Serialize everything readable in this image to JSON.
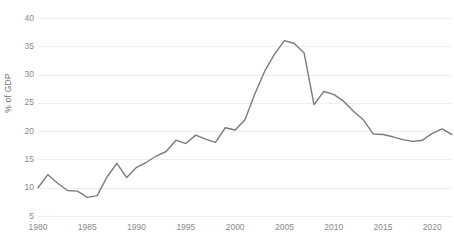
{
  "chart_data": {
    "type": "line",
    "title": "",
    "subtitle": "",
    "xlabel": "",
    "ylabel": "% of GDP",
    "xlim": [
      1980,
      2022
    ],
    "ylim": [
      5,
      40
    ],
    "grid": true,
    "legend": false,
    "legend_position": "none",
    "line_color": "#7b7b7b",
    "grid_color": "#eeeeee",
    "tick_color": "#8a8a8a",
    "background_color": "#ffffff",
    "y_ticks": [
      5,
      10,
      15,
      20,
      25,
      30,
      35,
      40
    ],
    "y_tick_labels": [
      "5",
      "10",
      "15",
      "20",
      "25",
      "30",
      "35",
      "40"
    ],
    "x_ticks": [
      1980,
      1985,
      1990,
      1995,
      2000,
      2005,
      2010,
      2015,
      2020
    ],
    "x_tick_labels": [
      "1980",
      "1985",
      "1990",
      "1995",
      "2000",
      "2005",
      "2010",
      "2015",
      "2020"
    ],
    "x": [
      1980,
      1981,
      1982,
      1983,
      1984,
      1985,
      1986,
      1987,
      1988,
      1989,
      1990,
      1991,
      1992,
      1993,
      1994,
      1995,
      1996,
      1997,
      1998,
      1999,
      2000,
      2001,
      2002,
      2003,
      2004,
      2005,
      2006,
      2007,
      2008,
      2009,
      2010,
      2011,
      2012,
      2013,
      2014,
      2015,
      2016,
      2017,
      2018,
      2019,
      2020,
      2021,
      2022
    ],
    "series": [
      {
        "name": "% of GDP",
        "values": [
          10.0,
          12.3,
          10.8,
          9.5,
          9.4,
          8.3,
          8.6,
          11.9,
          14.3,
          11.8,
          13.6,
          14.5,
          15.6,
          16.4,
          18.4,
          17.8,
          19.3,
          18.6,
          18.0,
          20.6,
          20.2,
          22.0,
          26.6,
          30.6,
          33.6,
          36.0,
          35.5,
          33.8,
          24.7,
          27.0,
          26.5,
          25.3,
          23.5,
          22.0,
          19.5,
          19.4,
          19.0,
          18.5,
          18.2,
          18.4,
          19.6,
          20.4,
          19.4
        ]
      }
    ]
  }
}
